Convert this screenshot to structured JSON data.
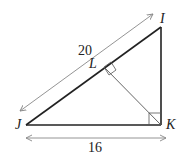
{
  "diagram": {
    "type": "right-triangle-with-altitude",
    "vertices": {
      "I": {
        "label": "I"
      },
      "J": {
        "label": "J"
      },
      "K": {
        "label": "K"
      },
      "L": {
        "label": "L"
      }
    },
    "measurements": {
      "JI": "20",
      "JK": "16"
    },
    "right_angles": [
      "K",
      "L"
    ],
    "colors": {
      "stroke": "#222222",
      "thin_stroke": "#555555",
      "arrow": "#888888"
    }
  }
}
